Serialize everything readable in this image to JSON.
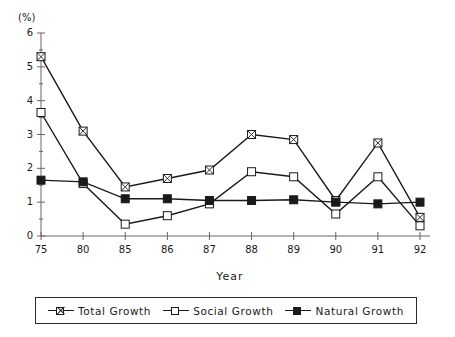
{
  "chart_data": {
    "type": "line",
    "title": "",
    "xlabel": "Year",
    "ylabel": "(%)",
    "unit_label": "(%)",
    "categories": [
      "75",
      "80",
      "85",
      "86",
      "87",
      "88",
      "89",
      "90",
      "91",
      "92"
    ],
    "xlim": [
      0,
      9
    ],
    "ylim": [
      0,
      6
    ],
    "ytick_labels": [
      "0",
      "1",
      "2",
      "3",
      "4",
      "5",
      "6"
    ],
    "ytick_values": [
      0,
      1,
      2,
      3,
      4,
      5,
      6
    ],
    "grid": false,
    "legend_position": "bottom",
    "series": [
      {
        "name": "Total Growth",
        "marker": "crossed-square",
        "values": [
          5.3,
          3.1,
          1.45,
          1.7,
          1.95,
          3.0,
          2.85,
          1.05,
          2.75,
          0.55
        ]
      },
      {
        "name": "Social Growth",
        "marker": "open-square",
        "values": [
          3.65,
          1.55,
          0.35,
          0.6,
          0.95,
          1.9,
          1.75,
          0.65,
          1.75,
          0.3
        ]
      },
      {
        "name": "Natural Growth",
        "marker": "filled-square",
        "values": [
          1.65,
          1.6,
          1.1,
          1.1,
          1.05,
          1.05,
          1.07,
          1.0,
          0.95,
          1.0
        ]
      }
    ]
  },
  "legend": {
    "items": [
      {
        "label": "Total Growth"
      },
      {
        "label": "Social Growth"
      },
      {
        "label": "Natural Growth"
      }
    ]
  },
  "colors": {
    "ink": "#1a1a1a",
    "axis": "#666666",
    "background": "#ffffff"
  }
}
